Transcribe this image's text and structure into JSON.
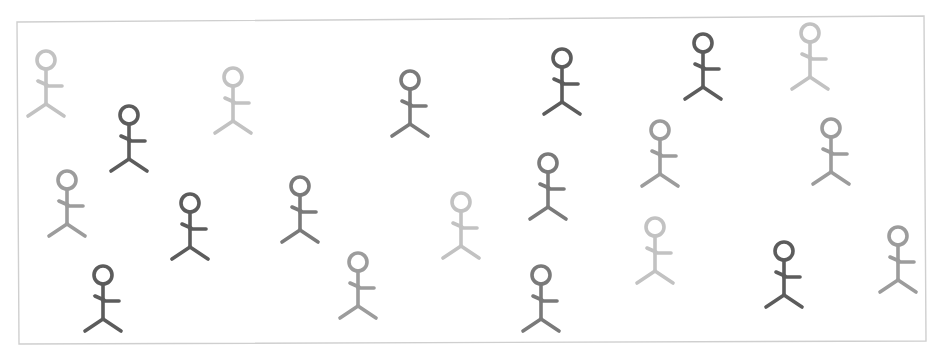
{
  "canvas": {
    "width": 939,
    "height": 355,
    "background": "#ffffff"
  },
  "frame": {
    "corners": [
      [
        17,
        22
      ],
      [
        924,
        16
      ],
      [
        926,
        341
      ],
      [
        19,
        344
      ]
    ],
    "stroke": "#cfcfcf"
  },
  "shades": {
    "light": "#c2c2c2",
    "medium": "#9c9c9c",
    "dark_medium": "#7a7a7a",
    "dark": "#5c5c5c"
  },
  "figure_style": {
    "head_radius": 9,
    "stroke_width": 3.6
  },
  "figures": [
    {
      "x": 46,
      "y": 60,
      "shade": "light"
    },
    {
      "x": 129,
      "y": 115,
      "shade": "dark"
    },
    {
      "x": 233,
      "y": 77,
      "shade": "light"
    },
    {
      "x": 410,
      "y": 80,
      "shade": "dark_medium"
    },
    {
      "x": 562,
      "y": 58,
      "shade": "dark"
    },
    {
      "x": 703,
      "y": 43,
      "shade": "dark"
    },
    {
      "x": 810,
      "y": 33,
      "shade": "light"
    },
    {
      "x": 67,
      "y": 180,
      "shade": "medium"
    },
    {
      "x": 190,
      "y": 203,
      "shade": "dark"
    },
    {
      "x": 300,
      "y": 186,
      "shade": "dark_medium"
    },
    {
      "x": 461,
      "y": 202,
      "shade": "light"
    },
    {
      "x": 548,
      "y": 163,
      "shade": "dark_medium"
    },
    {
      "x": 660,
      "y": 130,
      "shade": "medium"
    },
    {
      "x": 831,
      "y": 128,
      "shade": "medium"
    },
    {
      "x": 103,
      "y": 275,
      "shade": "dark"
    },
    {
      "x": 358,
      "y": 262,
      "shade": "medium"
    },
    {
      "x": 541,
      "y": 275,
      "shade": "dark_medium"
    },
    {
      "x": 655,
      "y": 227,
      "shade": "light"
    },
    {
      "x": 784,
      "y": 251,
      "shade": "dark"
    },
    {
      "x": 898,
      "y": 236,
      "shade": "medium"
    }
  ]
}
